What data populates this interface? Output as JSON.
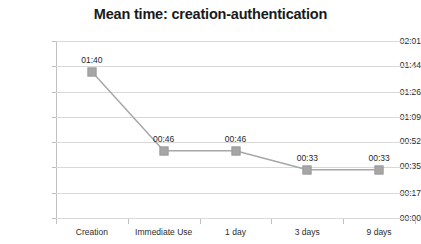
{
  "chart_data": {
    "type": "line",
    "title": "Mean time: creation-authentication",
    "xlabel": "",
    "ylabel": "",
    "categories": [
      "Creation",
      "Immediate Use",
      "1 day",
      "3 days",
      "9 days"
    ],
    "values": [
      "01:40",
      "00:46",
      "00:46",
      "00:33",
      "00:33"
    ],
    "values_seconds": [
      100,
      46,
      46,
      33,
      33
    ],
    "point_labels": [
      "01:40",
      "00:46",
      "00:46",
      "00:33",
      "00:33"
    ],
    "y_tick_labels": [
      "02:01",
      "01:44",
      "01:26",
      "01:09",
      "00:52",
      "00:35",
      "00:17",
      "00:00"
    ],
    "y_tick_seconds": [
      121,
      104,
      86,
      69,
      52,
      35,
      17,
      0
    ],
    "ylim_seconds": [
      0,
      121
    ],
    "grid": true,
    "legend": false,
    "legend_position": "none",
    "series": [
      {
        "name": "Mean time",
        "values": [
          "01:40",
          "00:46",
          "00:46",
          "00:33",
          "00:33"
        ],
        "values_seconds": [
          100,
          46,
          46,
          33,
          33
        ]
      }
    ],
    "colors": {
      "line": "#a6a6a6",
      "marker": "#a6a6a6",
      "gridline": "#d9d9d9",
      "axis": "#bfbfbf",
      "text": "#2b2b2b",
      "title": "#1a1a1a",
      "background": "#ffffff"
    }
  }
}
